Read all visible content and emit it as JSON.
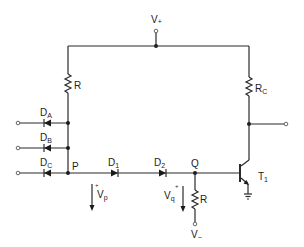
{
  "diagram": {
    "type": "circuit-schematic",
    "supply": {
      "positive": {
        "main": "V",
        "sub": "+"
      },
      "negative": {
        "main": "V",
        "sub": "−"
      }
    },
    "nodes": {
      "p": "P",
      "q": "Q"
    },
    "inputs": [
      {
        "name": "D",
        "sub": "A"
      },
      {
        "name": "D",
        "sub": "B"
      },
      {
        "name": "D",
        "sub": "C"
      }
    ],
    "series_diodes": [
      {
        "name": "D",
        "sub": "1"
      },
      {
        "name": "D",
        "sub": "2"
      }
    ],
    "resistors": {
      "pullup": "R",
      "collector": {
        "main": "R",
        "sub": "C"
      },
      "base": "R"
    },
    "transistor": {
      "main": "T",
      "sub": "1"
    },
    "voltages": {
      "vp": {
        "main": "V",
        "sub": "p",
        "polarity": "+"
      },
      "vq": {
        "main": "V",
        "sub": "q",
        "polarity": "+"
      }
    }
  }
}
